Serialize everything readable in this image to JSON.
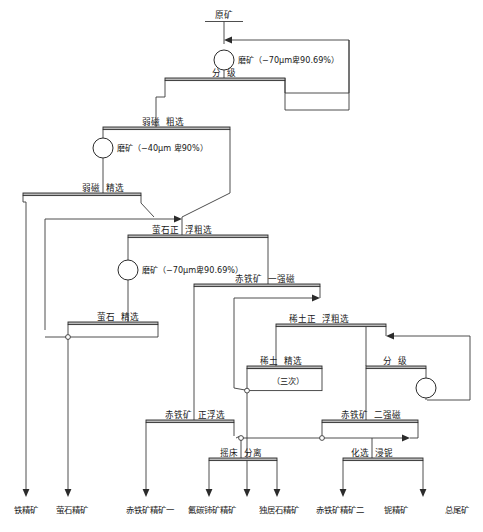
{
  "diagram": {
    "feed": {
      "label": "原矿"
    },
    "units": [
      {
        "id": "classify-1",
        "label_left": "分",
        "label_right": "级"
      },
      {
        "id": "lims-rough",
        "label_left": "弱磁",
        "label_right": "粗选"
      },
      {
        "id": "lims-clean",
        "label_left": "弱磁",
        "label_right": "精选"
      },
      {
        "id": "fluorite-rough",
        "label_left": "萤石正",
        "label_right": "浮粗选"
      },
      {
        "id": "fluorite-clean",
        "label_left": "萤石",
        "label_right": "精选"
      },
      {
        "id": "hims-1",
        "label_left": "赤铁矿",
        "label_right": "一强磁"
      },
      {
        "id": "re-rough",
        "label_left": "稀土正",
        "label_right": "浮粗选"
      },
      {
        "id": "re-clean",
        "label_left": "稀土",
        "label_right": "精选",
        "sub": "（三次）"
      },
      {
        "id": "classify-2",
        "label_left": "分",
        "label_right": "级"
      },
      {
        "id": "hem-float",
        "label_left": "赤铁矿",
        "label_right": "正浮选"
      },
      {
        "id": "hims-2",
        "label_left": "赤铁矿",
        "label_right": "二强磁"
      },
      {
        "id": "shaking-table",
        "label_left": "摇床",
        "label_right": "分离"
      },
      {
        "id": "leach-nb",
        "label_left": "化选",
        "label_right": "浸铌"
      }
    ],
    "mills": [
      {
        "id": "mill-1",
        "label": "磨矿（−70μm卑90.69%）"
      },
      {
        "id": "mill-2",
        "label": "磨矿（−40μm 卑90%）"
      },
      {
        "id": "mill-3",
        "label": "磨矿（−70μm卑90.69%）"
      },
      {
        "id": "mill-4",
        "label": ""
      }
    ],
    "products": [
      {
        "id": "prod-iron",
        "label": "铁精矿"
      },
      {
        "id": "prod-fluorite",
        "label": "萤石精矿"
      },
      {
        "id": "prod-hematite-1",
        "label": "赤铁矿精矿一"
      },
      {
        "id": "prod-bastnas",
        "label": "氟碳铈矿精矿"
      },
      {
        "id": "prod-monazite",
        "label": "独居石精矿"
      },
      {
        "id": "prod-hematite-2",
        "label": "赤铁矿精矿二"
      },
      {
        "id": "prod-niobium",
        "label": "铌精矿"
      },
      {
        "id": "prod-tailings",
        "label": "总尾矿"
      }
    ],
    "colors": {
      "line": "#3a3a3a",
      "bar_fill": "#b9b9b9",
      "text": "#181818",
      "background": "#ffffff"
    }
  }
}
